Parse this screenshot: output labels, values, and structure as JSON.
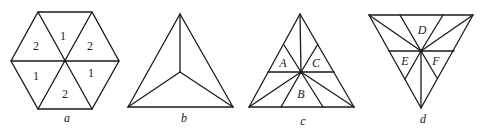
{
  "figures": [
    {
      "id": "a",
      "caption": "a",
      "shape": "hexagon",
      "region_labels": [
        "1",
        "2",
        "2",
        "1",
        "1",
        "2"
      ]
    },
    {
      "id": "b",
      "caption": "b",
      "shape": "triangle-with-centroid-spokes"
    },
    {
      "id": "c",
      "caption": "c",
      "shape": "triangle-subdivided",
      "region_labels": [
        "A",
        "C",
        "B"
      ]
    },
    {
      "id": "d",
      "caption": "d",
      "shape": "inverted-triangle-subdivided",
      "region_labels": [
        "D",
        "E",
        "F"
      ]
    }
  ],
  "colors": {
    "stroke": "#1a1a1a",
    "background": "#ffffff"
  }
}
